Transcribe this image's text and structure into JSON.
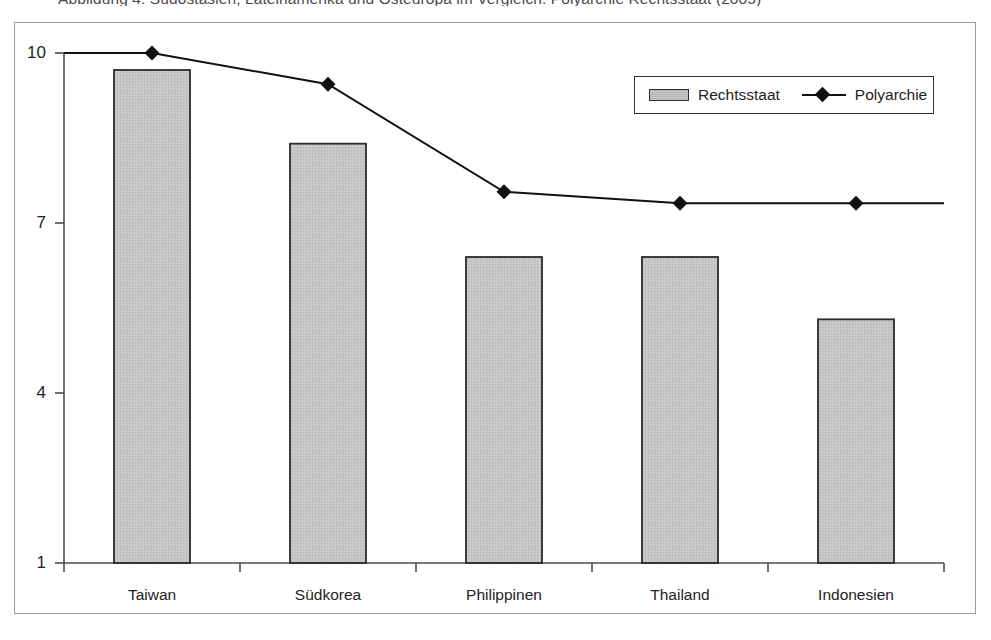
{
  "figure": {
    "caption": "Abbildung 4: Südostasien, Lateinamerika und Osteuropa im Vergleich: Polyarchie Rechtsstaat (2005)"
  },
  "legend": {
    "position": "top-right",
    "items": [
      {
        "label": "Rechtsstaat",
        "marker": "bar-swatch-icon",
        "color": "#c6c6c6"
      },
      {
        "label": "Polyarchie",
        "marker": "diamond-marker-icon",
        "color": "#111111"
      }
    ]
  },
  "colors": {
    "bar_fill": "#c6c6c6",
    "bar_stroke": "#2b2b2b",
    "line": "#111111",
    "marker": "#111111",
    "axis": "#4c4c4c",
    "frame": "#9a9a9a"
  },
  "chart_data": {
    "type": "bar",
    "title": "Abbildung 4: Südostasien, Lateinamerika und Osteuropa im Vergleich: Polyarchie Rechtsstaat (2005)",
    "xlabel": "",
    "ylabel": "",
    "ylim": [
      1,
      10
    ],
    "yticks": [
      1,
      4,
      7,
      10
    ],
    "grid": false,
    "legend_position": "top-right",
    "categories": [
      "Taiwan",
      "Südkorea",
      "Philippinen",
      "Thailand",
      "Indonesien"
    ],
    "series": [
      {
        "name": "Rechtsstaat",
        "type": "bar",
        "values": [
          9.7,
          8.4,
          6.4,
          6.4,
          5.3
        ]
      },
      {
        "name": "Polyarchie",
        "type": "line",
        "values": [
          10.0,
          9.45,
          7.55,
          7.35,
          7.35
        ]
      }
    ]
  }
}
